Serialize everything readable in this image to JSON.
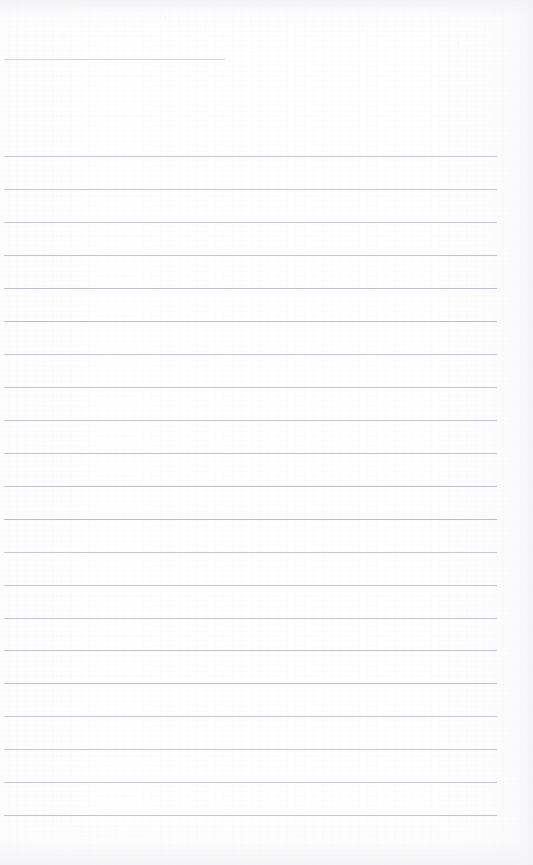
{
  "document": {
    "kind": "lined-notepad-page",
    "title": "Blank lined notepad page",
    "page_width": 533,
    "page_height": 865,
    "paper_color": "#fefefe",
    "rule_color": "#b9bcc4",
    "header_rule_color": "#c9ccd3",
    "content_text": "",
    "written_content": [],
    "rules": {
      "header_rule": {
        "name": "header-rule",
        "x": 4,
        "y": 59,
        "width": 221,
        "thickness": 1
      },
      "body_rule_left": 4,
      "body_rule_width": 493,
      "body_rule_thickness": 1,
      "body_rule_spacing": 32.95,
      "body_rule_count": 21,
      "body_rule_y": [
        156,
        189,
        222,
        255,
        288,
        321,
        354,
        387,
        420,
        453,
        486,
        519,
        552,
        585,
        618,
        650,
        683,
        716,
        749,
        782,
        815
      ]
    }
  }
}
